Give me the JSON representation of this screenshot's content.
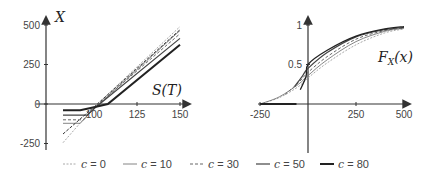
{
  "chart_data": [
    {
      "type": "line",
      "panel": "left",
      "title": "",
      "xlabel": "S(T)",
      "ylabel": "X",
      "xlim": [
        80,
        153
      ],
      "ylim": [
        -280,
        540
      ],
      "x_ticks": [
        100,
        125,
        150
      ],
      "x_tick_labels": [
        "100",
        "125",
        "150"
      ],
      "y_ticks": [
        -250,
        0,
        250,
        500
      ],
      "y_tick_labels": [
        "-250",
        "0",
        "250",
        "500"
      ],
      "grid": false,
      "series": [
        {
          "name": "c = 0",
          "style": "dotted-light",
          "points": [
            [
              82,
              -245
            ],
            [
              100,
              -20
            ],
            [
              150,
              490
            ]
          ]
        },
        {
          "name": "c = 10",
          "style": "thin-solid",
          "points": [
            [
              82,
              -122
            ],
            [
              92,
              -122
            ],
            [
              100,
              -30
            ],
            [
              150,
              465
            ]
          ]
        },
        {
          "name": "c = 30",
          "style": "dashed",
          "points": [
            [
              82,
              -100
            ],
            [
              94,
              -100
            ],
            [
              100,
              -25
            ],
            [
              150,
              445
            ]
          ]
        },
        {
          "name": "c = 50",
          "style": "solid",
          "points": [
            [
              82,
              -70
            ],
            [
              96,
              -70
            ],
            [
              101,
              -20
            ],
            [
              150,
              415
            ]
          ]
        },
        {
          "name": "c = 80",
          "style": "thick-solid",
          "points": [
            [
              82,
              -40
            ],
            [
              92,
              -40
            ],
            [
              98,
              -25
            ],
            [
              108,
              0
            ],
            [
              150,
              375
            ]
          ]
        },
        {
          "name": "diag-a",
          "style": "dashed-dark",
          "points": [
            [
              82,
              -190
            ],
            [
              102,
              0
            ],
            [
              150,
              470
            ]
          ]
        }
      ]
    },
    {
      "type": "line",
      "panel": "right",
      "title": "",
      "xlabel": "",
      "ylabel": "F_X(x)",
      "curve_label": "F_X(x)",
      "xlim": [
        -260,
        520
      ],
      "ylim": [
        -0.6,
        1.05
      ],
      "x_ticks": [
        -250,
        250,
        500
      ],
      "x_tick_labels": [
        "-250",
        "250",
        "500"
      ],
      "y_ticks": [
        0.5,
        1
      ],
      "y_tick_labels": [
        "0.5",
        "1"
      ],
      "grid": false,
      "series": [
        {
          "name": "c = 0",
          "style": "dotted-light",
          "points": [
            [
              -250,
              0.0
            ],
            [
              -150,
              0.08
            ],
            [
              -50,
              0.22
            ],
            [
              0,
              0.33
            ],
            [
              100,
              0.52
            ],
            [
              250,
              0.75
            ],
            [
              400,
              0.9
            ],
            [
              500,
              0.95
            ]
          ]
        },
        {
          "name": "c = 10",
          "style": "thin-solid",
          "points": [
            [
              -250,
              0.0
            ],
            [
              -150,
              0.09
            ],
            [
              -50,
              0.25
            ],
            [
              0,
              0.36
            ],
            [
              100,
              0.56
            ],
            [
              250,
              0.79
            ],
            [
              400,
              0.92
            ],
            [
              500,
              0.96
            ]
          ]
        },
        {
          "name": "c = 30",
          "style": "dashed",
          "points": [
            [
              -120,
              0.12
            ],
            [
              -50,
              0.27
            ],
            [
              0,
              0.4
            ],
            [
              100,
              0.6
            ],
            [
              250,
              0.82
            ],
            [
              400,
              0.93
            ],
            [
              500,
              0.96
            ]
          ]
        },
        {
          "name": "c = 50",
          "style": "solid",
          "points": [
            [
              -70,
              0.22
            ],
            [
              -30,
              0.35
            ],
            [
              0,
              0.45
            ],
            [
              100,
              0.65
            ],
            [
              250,
              0.85
            ],
            [
              400,
              0.94
            ],
            [
              500,
              0.97
            ]
          ]
        },
        {
          "name": "c = 80",
          "style": "thick-solid",
          "points": [
            [
              -250,
              0.0
            ],
            [
              -60,
              0.0
            ]
          ],
          "extra": [
            [
              -40,
              0.18
            ],
            [
              -10,
              0.35
            ],
            [
              0,
              0.5
            ],
            [
              100,
              0.68
            ],
            [
              250,
              0.86
            ],
            [
              400,
              0.95
            ],
            [
              500,
              0.98
            ]
          ]
        }
      ]
    }
  ],
  "legend": {
    "placement": "bottom",
    "items": [
      {
        "var": "c",
        "eq": " = 0",
        "style": "dotted-light"
      },
      {
        "var": "c",
        "eq": " = 10",
        "style": "thin-solid"
      },
      {
        "var": "c",
        "eq": " = 30",
        "style": "dashed"
      },
      {
        "var": "c",
        "eq": " = 50",
        "style": "solid"
      },
      {
        "var": "c",
        "eq": " = 80",
        "style": "thick-solid"
      }
    ]
  },
  "styles": {
    "dotted-light": {
      "color": "#a8a8a8",
      "width": 1,
      "dash": "2,1.5"
    },
    "thin-solid": {
      "color": "#777777",
      "width": 0.9,
      "dash": ""
    },
    "dashed": {
      "color": "#666666",
      "width": 1,
      "dash": "3,2"
    },
    "solid": {
      "color": "#444444",
      "width": 1.2,
      "dash": ""
    },
    "thick-solid": {
      "color": "#222222",
      "width": 2,
      "dash": ""
    },
    "dashed-dark": {
      "color": "#333333",
      "width": 1,
      "dash": "3,1.5"
    }
  },
  "axis_color": "#333333"
}
